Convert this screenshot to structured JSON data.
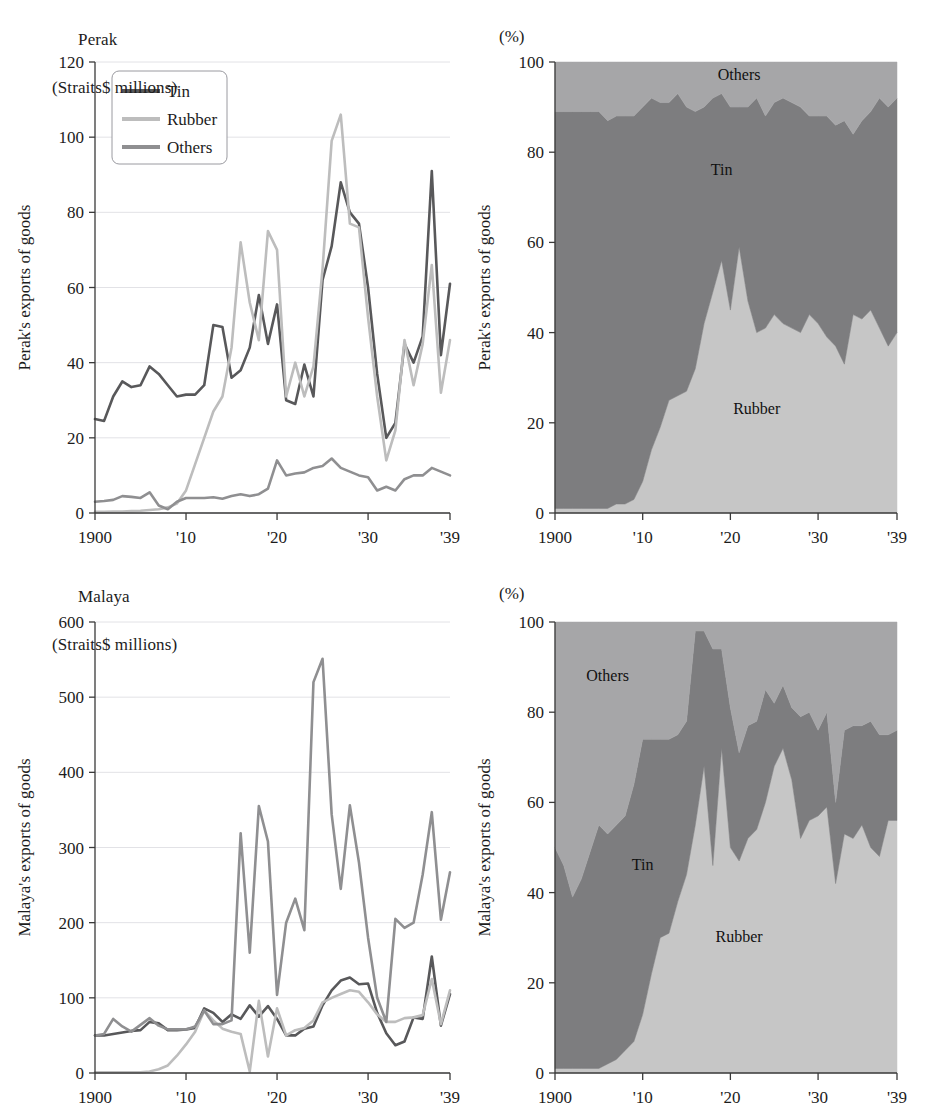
{
  "figure": {
    "colors": {
      "tin": "#58585a",
      "rubber": "#bdbdbd",
      "others": "#8f8f91",
      "area_tin": "#7d7d7f",
      "area_rubber": "#c6c6c6",
      "area_others": "#a6a6a8",
      "grid": "#e2e2e6",
      "axis": "#3a3a3a",
      "text": "#1c1c1c"
    },
    "legend": {
      "items": [
        {
          "label": "Tin",
          "color": "#58585a"
        },
        {
          "label": "Rubber",
          "color": "#bdbdbd"
        },
        {
          "label": "Others",
          "color": "#8f8f91"
        }
      ]
    },
    "panels": [
      {
        "id": "perak-levels",
        "title_line1": "Perak",
        "title_line2": "(Straits$ millions)",
        "ylabel": "Perak's exports of goods",
        "unit_label": "",
        "has_legend": true
      },
      {
        "id": "perak-shares",
        "title_line1": "",
        "title_line2": "",
        "ylabel": "Perak's exports of goods",
        "unit_label": "(%)",
        "has_legend": false
      },
      {
        "id": "malaya-levels",
        "title_line1": "Malaya",
        "title_line2": "(Straits$ millions)",
        "ylabel": "Malaya's exports of goods",
        "unit_label": "",
        "has_legend": false
      },
      {
        "id": "malaya-shares",
        "title_line1": "",
        "title_line2": "",
        "ylabel": "Malaya's exports of goods",
        "unit_label": "(%)",
        "has_legend": false
      }
    ]
  },
  "chart_data": [
    {
      "id": "perak-levels",
      "type": "line",
      "title": "Perak (Straits$ millions)",
      "xlabel": "",
      "ylabel": "Perak's exports of goods",
      "xlim": [
        1900,
        1939
      ],
      "ylim": [
        0,
        120
      ],
      "yticks": [
        0,
        20,
        40,
        60,
        80,
        100,
        120
      ],
      "xticks": [
        1900,
        1910,
        1920,
        1930,
        1939
      ],
      "xticklabels": [
        "1900",
        "'10",
        "'20",
        "'30",
        "'39"
      ],
      "grid": true,
      "legend": "upper-left",
      "x": [
        1900,
        1901,
        1902,
        1903,
        1904,
        1905,
        1906,
        1907,
        1908,
        1909,
        1910,
        1911,
        1912,
        1913,
        1914,
        1915,
        1916,
        1917,
        1918,
        1919,
        1920,
        1921,
        1922,
        1923,
        1924,
        1925,
        1926,
        1927,
        1928,
        1929,
        1930,
        1931,
        1932,
        1933,
        1934,
        1935,
        1936,
        1937,
        1938,
        1939
      ],
      "series": [
        {
          "name": "Tin",
          "color": "#58585a",
          "values": [
            25,
            24.5,
            31,
            35,
            33.5,
            34,
            39,
            37,
            34,
            31,
            31.5,
            31.5,
            34,
            50,
            49.5,
            36,
            38,
            44,
            58,
            45,
            55.5,
            30,
            29,
            39.5,
            31,
            62,
            71,
            88,
            80,
            77,
            60,
            37,
            20,
            24,
            45,
            40,
            47,
            91,
            42,
            61
          ]
        },
        {
          "name": "Rubber",
          "color": "#bdbdbd",
          "values": [
            0.3,
            0.3,
            0.4,
            0.4,
            0.5,
            0.6,
            0.8,
            1,
            1.5,
            2.5,
            6,
            13,
            20,
            27,
            31,
            44,
            72,
            56,
            46,
            75,
            70,
            31,
            40,
            31,
            39,
            65,
            99,
            106,
            77,
            76,
            52,
            31,
            14,
            22,
            46,
            34,
            45,
            66,
            32,
            46
          ]
        },
        {
          "name": "Others",
          "color": "#8f8f91",
          "values": [
            3,
            3.2,
            3.5,
            4.5,
            4.3,
            4,
            5.5,
            2,
            1,
            3,
            4,
            4,
            4,
            4.2,
            3.8,
            4.5,
            5,
            4.5,
            5,
            6.5,
            14,
            10,
            10.5,
            10.8,
            12,
            12.5,
            14.5,
            12,
            11,
            10,
            9.5,
            6,
            7,
            6,
            9,
            10,
            10,
            12,
            11,
            10
          ]
        }
      ]
    },
    {
      "id": "perak-shares",
      "type": "area",
      "stacked": true,
      "title": "Perak's exports of goods (%)",
      "xlabel": "",
      "ylabel": "Perak's exports of goods",
      "unit": "(%)",
      "xlim": [
        1900,
        1939
      ],
      "ylim": [
        0,
        100
      ],
      "yticks": [
        0,
        20,
        40,
        60,
        80,
        100
      ],
      "xticks": [
        1900,
        1910,
        1920,
        1930,
        1939
      ],
      "xticklabels": [
        "1900",
        "'10",
        "'20",
        "'30",
        "'39"
      ],
      "grid": false,
      "annotations": [
        {
          "text": "Others",
          "x": 1921,
          "y": 96
        },
        {
          "text": "Tin",
          "x": 1919,
          "y": 75
        },
        {
          "text": "Rubber",
          "x": 1923,
          "y": 22
        }
      ],
      "x": [
        1900,
        1901,
        1902,
        1903,
        1904,
        1905,
        1906,
        1907,
        1908,
        1909,
        1910,
        1911,
        1912,
        1913,
        1914,
        1915,
        1916,
        1917,
        1918,
        1919,
        1920,
        1921,
        1922,
        1923,
        1924,
        1925,
        1926,
        1927,
        1928,
        1929,
        1930,
        1931,
        1932,
        1933,
        1934,
        1935,
        1936,
        1937,
        1938,
        1939
      ],
      "series": [
        {
          "name": "Rubber",
          "color": "#c6c6c6",
          "values": [
            1,
            1,
            1,
            1,
            1,
            1,
            1,
            2,
            2,
            3,
            7,
            14,
            19,
            25,
            26,
            27,
            32,
            42,
            49,
            56,
            45,
            59,
            47,
            40,
            41,
            44,
            42,
            41,
            40,
            44,
            42,
            39,
            37,
            33,
            44,
            43,
            45,
            41,
            37,
            40
          ]
        },
        {
          "name": "Tin",
          "color": "#7d7d7f",
          "values": [
            88,
            88,
            88,
            88,
            88,
            88,
            86,
            86,
            86,
            85,
            83,
            78,
            72,
            66,
            67,
            63,
            57,
            48,
            43,
            37,
            45,
            31,
            43,
            52,
            47,
            47,
            50,
            50,
            50,
            44,
            46,
            49,
            49,
            54,
            40,
            44,
            44,
            51,
            53,
            52
          ]
        },
        {
          "name": "Others",
          "color": "#a6a6a8",
          "values": [
            11,
            11,
            11,
            11,
            11,
            11,
            13,
            12,
            12,
            12,
            10,
            8,
            9,
            9,
            7,
            10,
            11,
            10,
            8,
            7,
            10,
            10,
            10,
            8,
            12,
            9,
            8,
            9,
            10,
            12,
            12,
            12,
            14,
            13,
            16,
            13,
            11,
            8,
            10,
            8
          ]
        }
      ]
    },
    {
      "id": "malaya-levels",
      "type": "line",
      "title": "Malaya (Straits$ millions)",
      "xlabel": "",
      "ylabel": "Malaya's exports of goods",
      "xlim": [
        1900,
        1939
      ],
      "ylim": [
        0,
        600
      ],
      "yticks": [
        0,
        100,
        200,
        300,
        400,
        500,
        600
      ],
      "xticks": [
        1900,
        1910,
        1920,
        1930,
        1939
      ],
      "xticklabels": [
        "1900",
        "'10",
        "'20",
        "'30",
        "'39"
      ],
      "grid": true,
      "x": [
        1900,
        1901,
        1902,
        1903,
        1904,
        1905,
        1906,
        1907,
        1908,
        1909,
        1910,
        1911,
        1912,
        1913,
        1914,
        1915,
        1916,
        1917,
        1918,
        1919,
        1920,
        1921,
        1922,
        1923,
        1924,
        1925,
        1926,
        1927,
        1928,
        1929,
        1930,
        1931,
        1932,
        1933,
        1934,
        1935,
        1936,
        1937,
        1938,
        1939
      ],
      "series": [
        {
          "name": "Tin",
          "color": "#58585a",
          "values": [
            50,
            50,
            52,
            54,
            56,
            57,
            68,
            66,
            57,
            57,
            58,
            60,
            86,
            80,
            68,
            78,
            72,
            90,
            75,
            89,
            72,
            50,
            50,
            59,
            62,
            90,
            110,
            123,
            127,
            118,
            119,
            80,
            53,
            37,
            42,
            74,
            72,
            155,
            63,
            105
          ]
        },
        {
          "name": "Rubber",
          "color": "#bdbdbd",
          "values": [
            1,
            1,
            1,
            1,
            1,
            1,
            2,
            5,
            10,
            23,
            38,
            55,
            83,
            70,
            59,
            55,
            52,
            2,
            96,
            22,
            86,
            50,
            57,
            60,
            70,
            94,
            100,
            105,
            110,
            108,
            94,
            78,
            68,
            68,
            73,
            74,
            77,
            125,
            65,
            110
          ]
        },
        {
          "name": "Others",
          "color": "#8f8f91",
          "values": [
            50,
            52,
            72,
            62,
            55,
            64,
            73,
            63,
            58,
            58,
            58,
            62,
            83,
            65,
            65,
            70,
            319,
            160,
            355,
            308,
            104,
            200,
            232,
            190,
            520,
            551,
            344,
            245,
            356,
            280,
            180,
            100,
            68,
            205,
            193,
            200,
            264,
            347,
            204,
            267
          ]
        }
      ]
    },
    {
      "id": "malaya-shares",
      "type": "area",
      "stacked": true,
      "title": "Malaya's exports of goods (%)",
      "xlabel": "",
      "ylabel": "Malaya's exports of goods",
      "unit": "(%)",
      "xlim": [
        1900,
        1939
      ],
      "ylim": [
        0,
        100
      ],
      "yticks": [
        0,
        20,
        40,
        60,
        80,
        100
      ],
      "xticks": [
        1900,
        1910,
        1920,
        1930,
        1939
      ],
      "xticklabels": [
        "1900",
        "'10",
        "'20",
        "'30",
        "'39"
      ],
      "grid": false,
      "annotations": [
        {
          "text": "Others",
          "x": 1906,
          "y": 87
        },
        {
          "text": "Tin",
          "x": 1910,
          "y": 45
        },
        {
          "text": "Rubber",
          "x": 1921,
          "y": 29
        }
      ],
      "x": [
        1900,
        1901,
        1902,
        1903,
        1904,
        1905,
        1906,
        1907,
        1908,
        1909,
        1910,
        1911,
        1912,
        1913,
        1914,
        1915,
        1916,
        1917,
        1918,
        1919,
        1920,
        1921,
        1922,
        1923,
        1924,
        1925,
        1926,
        1927,
        1928,
        1929,
        1930,
        1931,
        1932,
        1933,
        1934,
        1935,
        1936,
        1937,
        1938,
        1939
      ],
      "series": [
        {
          "name": "Rubber",
          "color": "#c6c6c6",
          "values": [
            1,
            1,
            1,
            1,
            1,
            1,
            2,
            3,
            5,
            7,
            13,
            22,
            30,
            31,
            38,
            44,
            55,
            68,
            46,
            72,
            50,
            47,
            52,
            54,
            60,
            68,
            72,
            65,
            52,
            56,
            57,
            59,
            42,
            53,
            52,
            55,
            50,
            48,
            56,
            56
          ]
        },
        {
          "name": "Tin",
          "color": "#7d7d7f",
          "values": [
            49,
            45,
            38,
            42,
            48,
            54,
            51,
            52,
            52,
            57,
            61,
            52,
            44,
            43,
            37,
            34,
            43,
            30,
            48,
            22,
            31,
            24,
            25,
            24,
            25,
            14,
            14,
            16,
            27,
            24,
            19,
            21,
            18,
            23,
            25,
            22,
            28,
            27,
            19,
            20
          ]
        },
        {
          "name": "Others",
          "color": "#a6a6a8",
          "values": [
            50,
            54,
            61,
            57,
            51,
            45,
            47,
            45,
            43,
            36,
            26,
            26,
            26,
            26,
            25,
            22,
            2,
            2,
            6,
            6,
            19,
            29,
            23,
            22,
            15,
            18,
            14,
            19,
            21,
            20,
            24,
            20,
            40,
            24,
            23,
            23,
            22,
            25,
            25,
            24
          ]
        }
      ]
    }
  ]
}
